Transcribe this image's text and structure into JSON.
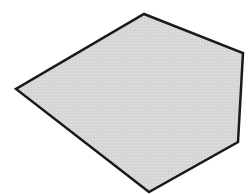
{
  "diagram": {
    "shape_type": "irregular pentagon",
    "vertices": [
      {
        "x": 144,
        "y": 14
      },
      {
        "x": 243,
        "y": 53
      },
      {
        "x": 238,
        "y": 142
      },
      {
        "x": 149,
        "y": 192
      },
      {
        "x": 16,
        "y": 89
      }
    ],
    "fill_color": "#d8d8d8",
    "stroke_color": "#1a1a1a",
    "stroke_width": 2.5
  }
}
